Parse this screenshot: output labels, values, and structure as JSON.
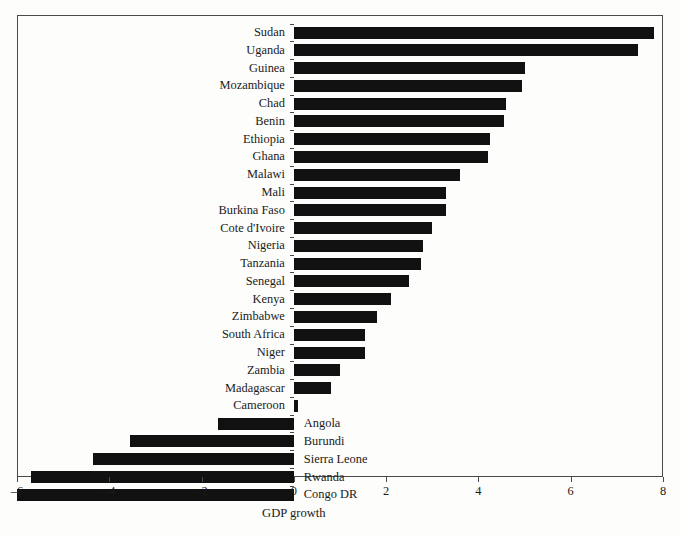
{
  "chart_data": {
    "type": "bar",
    "orientation": "horizontal",
    "title": "",
    "xlabel": "GDP growth",
    "ylabel": "",
    "xlim": [
      -6,
      8
    ],
    "ylim": null,
    "grid": false,
    "legend": null,
    "xticks": [
      -6,
      -4,
      -2,
      0,
      2,
      4,
      6,
      8
    ],
    "xticklabels": [
      "–6",
      "–4",
      "–2",
      "0",
      "2",
      "4",
      "6",
      "8"
    ],
    "bar_color": "#111111",
    "categories": [
      "Sudan",
      "Uganda",
      "Guinea",
      "Mozambique",
      "Chad",
      "Benin",
      "Ethiopia",
      "Ghana",
      "Malawi",
      "Mali",
      "Burkina Faso",
      "Cote d'Ivoire",
      "Nigeria",
      "Tanzania",
      "Senegal",
      "Kenya",
      "Zimbabwe",
      "South Africa",
      "Niger",
      "Zambia",
      "Madagascar",
      "Cameroon",
      "Angola",
      "Burundi",
      "Sierra Leone",
      "Rwanda",
      "Congo DR"
    ],
    "values": [
      7.8,
      7.45,
      5.0,
      4.95,
      4.6,
      4.55,
      4.25,
      4.2,
      3.6,
      3.3,
      3.3,
      3.0,
      2.8,
      2.75,
      2.5,
      2.1,
      1.8,
      1.55,
      1.55,
      1.0,
      0.8,
      0.1,
      -1.65,
      -3.55,
      -4.35,
      -5.7,
      -6.0
    ]
  }
}
